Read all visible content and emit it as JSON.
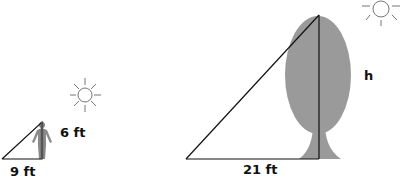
{
  "diagram": {
    "type": "similar-triangles-shadow",
    "person": {
      "height_label": "6 ft",
      "shadow_label": "9 ft"
    },
    "tree": {
      "height_label": "h",
      "shadow_label": "21 ft"
    },
    "colors": {
      "line": "#111111",
      "tree": "#9a9a9a",
      "person": "#8a8a8a",
      "sun": "#777777"
    }
  }
}
